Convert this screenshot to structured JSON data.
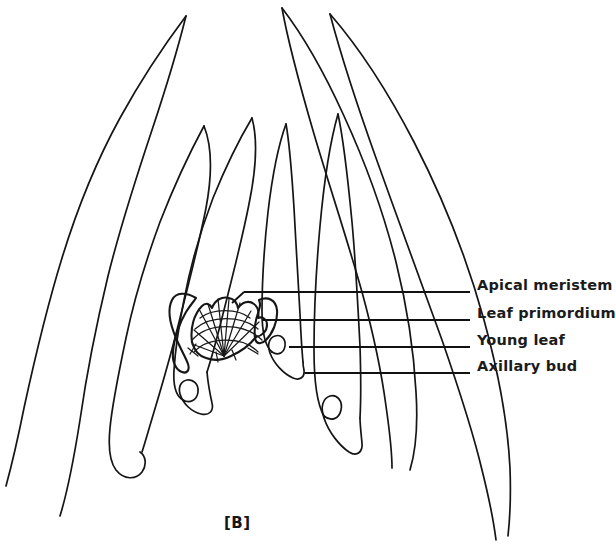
{
  "figure": {
    "caption": "[B]",
    "background_color": "#ffffff",
    "ink_color": "#151515",
    "width": 599,
    "height": 545
  },
  "labels": [
    {
      "id": "apical-meristem",
      "text": "Apical meristem",
      "text_x": 477,
      "text_y": 285,
      "leader": {
        "x1": 244,
        "y1": 292,
        "x2": 470,
        "y2": 292
      }
    },
    {
      "id": "leaf-primordium",
      "text": "Leaf primordium",
      "text_x": 477,
      "text_y": 313,
      "leader": {
        "x1": 262,
        "y1": 320,
        "x2": 470,
        "y2": 320
      }
    },
    {
      "id": "young-leaf",
      "text": "Young leaf",
      "text_x": 477,
      "text_y": 340,
      "leader": {
        "x1": 289,
        "y1": 347,
        "x2": 470,
        "y2": 347
      }
    },
    {
      "id": "axillary-bud",
      "text": "Axillary bud",
      "text_x": 477,
      "text_y": 366,
      "leader": {
        "x1": 305,
        "y1": 373,
        "x2": 470,
        "y2": 373
      }
    }
  ],
  "structures": {
    "apical_meristem": {
      "name": "apical meristem dome",
      "center_x": 224,
      "base_y": 355,
      "radius_x": 33,
      "radius_y": 38,
      "radial_line_count": 9,
      "arc_line_count": 4
    },
    "leaf_count_left": 4,
    "leaf_count_right": 4,
    "axillary_bud_count": 4
  },
  "caption_position": {
    "x": 232,
    "y": 524
  }
}
